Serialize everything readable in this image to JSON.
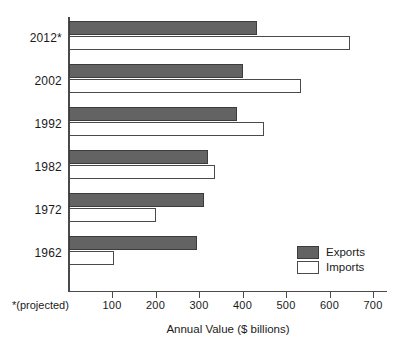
{
  "chart_data": {
    "type": "bar",
    "orientation": "horizontal",
    "title": "",
    "xlabel": "Annual Value ($ billions)",
    "ylabel": "",
    "xlim": [
      0,
      740
    ],
    "xticks": [
      100,
      200,
      300,
      400,
      500,
      600,
      700
    ],
    "xtick_labels": [
      "100",
      "200",
      "300",
      "400",
      "500",
      "600",
      "700"
    ],
    "categories": [
      "2012*",
      "2002",
      "1992",
      "1982",
      "1972",
      "1962"
    ],
    "grid": false,
    "legend_position": "bottom-right",
    "series": [
      {
        "name": "Exports",
        "color": "#636363",
        "values": [
          433,
          401,
          387,
          320,
          311,
          296
        ]
      },
      {
        "name": "Imports",
        "color": "#ffffff",
        "values": [
          646,
          534,
          449,
          337,
          201,
          105
        ]
      }
    ],
    "annotations": [
      {
        "name": "projected-footnote",
        "text": "*(projected)"
      }
    ]
  },
  "axis": {
    "x_title": "Annual Value ($ billions)",
    "footnote": "*(projected)",
    "ticks": [
      {
        "value": 100,
        "label": "100"
      },
      {
        "value": 200,
        "label": "200"
      },
      {
        "value": 300,
        "label": "300"
      },
      {
        "value": 400,
        "label": "400"
      },
      {
        "value": 500,
        "label": "500"
      },
      {
        "value": 600,
        "label": "600"
      },
      {
        "value": 700,
        "label": "700"
      }
    ]
  },
  "groups": [
    {
      "year": "2012*",
      "exports": 433,
      "imports": 646
    },
    {
      "year": "2002",
      "exports": 401,
      "imports": 534
    },
    {
      "year": "1992",
      "exports": 387,
      "imports": 449
    },
    {
      "year": "1982",
      "exports": 320,
      "imports": 337
    },
    {
      "year": "1972",
      "exports": 311,
      "imports": 201
    },
    {
      "year": "1962",
      "exports": 296,
      "imports": 105
    }
  ],
  "legend": {
    "exports_label": "Exports",
    "imports_label": "Imports",
    "exports_color": "#636363",
    "imports_color": "#FFFFFF"
  }
}
